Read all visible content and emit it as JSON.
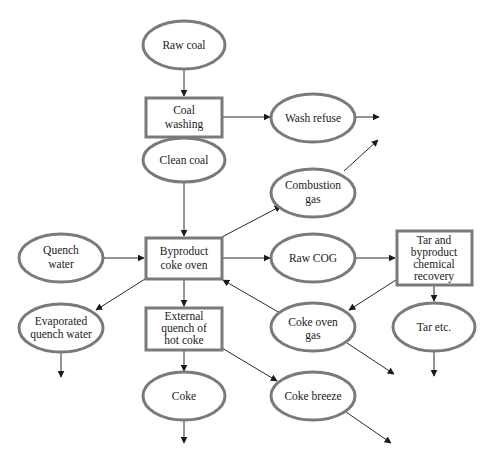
{
  "diagram": {
    "type": "flowchart",
    "colors": {
      "node_border": "#7a7a7a",
      "edge": "#2a2a2a",
      "text": "#1a1a1a",
      "background": "#ffffff"
    },
    "nodes": {
      "raw_coal": {
        "shape": "ellipse",
        "lines": [
          "Raw coal"
        ]
      },
      "coal_washing": {
        "shape": "rect",
        "lines": [
          "Coal",
          "washing"
        ]
      },
      "wash_refuse": {
        "shape": "ellipse",
        "lines": [
          "Wash refuse"
        ]
      },
      "clean_coal": {
        "shape": "ellipse",
        "lines": [
          "Clean coal"
        ]
      },
      "combustion_gas": {
        "shape": "ellipse",
        "lines": [
          "Combustion",
          "gas"
        ]
      },
      "quench_water": {
        "shape": "ellipse",
        "lines": [
          "Quench",
          "water"
        ]
      },
      "byproduct_coke_oven": {
        "shape": "rect",
        "lines": [
          "Byproduct",
          "coke oven"
        ]
      },
      "raw_cog": {
        "shape": "ellipse",
        "lines": [
          "Raw COG"
        ]
      },
      "tar_recovery": {
        "shape": "rect",
        "lines": [
          "Tar and",
          "byproduct",
          "chemical",
          "recovery"
        ]
      },
      "evaporated_quench_water": {
        "shape": "ellipse",
        "lines": [
          "Evaporated",
          "quench water"
        ]
      },
      "external_quench": {
        "shape": "rect",
        "lines": [
          "External",
          "quench of",
          "hot coke"
        ]
      },
      "coke_oven_gas": {
        "shape": "ellipse",
        "lines": [
          "Coke oven",
          "gas"
        ]
      },
      "tar_etc": {
        "shape": "ellipse",
        "lines": [
          "Tar etc."
        ]
      },
      "coke": {
        "shape": "ellipse",
        "lines": [
          "Coke"
        ]
      },
      "coke_breeze": {
        "shape": "ellipse",
        "lines": [
          "Coke breeze"
        ]
      }
    },
    "edges": [
      {
        "from": "Raw coal",
        "to": "Coal washing"
      },
      {
        "from": "Coal washing",
        "to": "Wash refuse"
      },
      {
        "from": "Wash refuse",
        "to": "(out)"
      },
      {
        "from": "Coal washing",
        "to": "Clean coal"
      },
      {
        "from": "Clean coal",
        "to": "Byproduct coke oven"
      },
      {
        "from": "Byproduct coke oven",
        "to": "Combustion gas"
      },
      {
        "from": "Combustion gas",
        "to": "(out)"
      },
      {
        "from": "Quench water",
        "to": "Byproduct coke oven"
      },
      {
        "from": "Byproduct coke oven",
        "to": "Raw COG"
      },
      {
        "from": "Raw COG",
        "to": "Tar and byproduct chemical recovery"
      },
      {
        "from": "Tar and byproduct chemical recovery",
        "to": "Coke oven gas"
      },
      {
        "from": "Tar and byproduct chemical recovery",
        "to": "Tar etc."
      },
      {
        "from": "Tar etc.",
        "to": "(out)"
      },
      {
        "from": "Coke oven gas",
        "to": "Byproduct coke oven"
      },
      {
        "from": "Coke oven gas",
        "to": "(out)"
      },
      {
        "from": "Byproduct coke oven",
        "to": "Evaporated quench water"
      },
      {
        "from": "Evaporated quench water",
        "to": "(out)"
      },
      {
        "from": "Byproduct coke oven",
        "to": "External quench of hot coke"
      },
      {
        "from": "External quench of hot coke",
        "to": "Coke"
      },
      {
        "from": "Coke",
        "to": "(out)"
      },
      {
        "from": "External quench of hot coke",
        "to": "Coke breeze"
      },
      {
        "from": "Coke breeze",
        "to": "(out)"
      }
    ]
  }
}
